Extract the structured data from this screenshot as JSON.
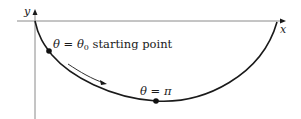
{
  "figure": {
    "type": "cycloid-path-diagram",
    "axes": {
      "x_label": "x",
      "y_label": "y"
    },
    "annotations": {
      "start": {
        "theta_symbol": "θ",
        "equals": " = ",
        "theta0_base": "θ",
        "theta0_sub": "0",
        "text": " starting point"
      },
      "bottom": {
        "theta_symbol": "θ",
        "equals": " = ",
        "value": "π"
      }
    },
    "points": [
      {
        "name": "starting-point",
        "label": "θ = θ0 starting point"
      },
      {
        "name": "bottom-point",
        "label": "θ = π"
      }
    ],
    "direction_arrow": "motion along curve toward bottom",
    "colors": {
      "curve": "#1a1a1a",
      "axis": "#8a8a8a",
      "text": "#1a1a1a"
    }
  }
}
